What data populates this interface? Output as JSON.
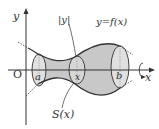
{
  "diagram": {
    "labels": {
      "y_axis": "y",
      "x_axis": "x",
      "origin": "O",
      "abs_y": "|y|",
      "curve": "y=f(x)",
      "a": "a",
      "b": "b",
      "x_pos": "x",
      "cross_section": "S(x)"
    },
    "colors": {
      "solid_fill": "#c8c8c8",
      "section_fill": "#dcdcdc",
      "stroke": "#333333",
      "background": "#ffffff"
    }
  }
}
